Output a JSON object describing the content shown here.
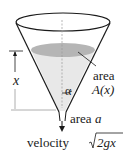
{
  "diagram": {
    "labels": {
      "height_var": "x",
      "angle": "α",
      "area_surface_line1": "area",
      "area_surface_line2": "A(x)",
      "area_hole_prefix": "area ",
      "area_hole_var": "a",
      "velocity_prefix": "velocity",
      "velocity_radicand": "2gx"
    },
    "colors": {
      "stroke": "#1a1a1a",
      "liquid_surface": "#b3b3b3",
      "liquid_body": "#e6e6e6",
      "axis": "#9a9a9a"
    }
  }
}
